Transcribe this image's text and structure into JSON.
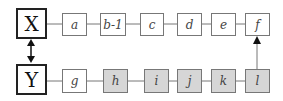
{
  "diagram": {
    "top_main": {
      "label": "X"
    },
    "bottom_main": {
      "label": "Y"
    },
    "top_row": [
      {
        "label": "a",
        "shaded": false
      },
      {
        "label": "b-1",
        "shaded": false
      },
      {
        "label": "c",
        "shaded": false
      },
      {
        "label": "d",
        "shaded": false
      },
      {
        "label": "e",
        "shaded": false
      },
      {
        "label": "f",
        "shaded": false
      }
    ],
    "bottom_row": [
      {
        "label": "g",
        "shaded": false
      },
      {
        "label": "h",
        "shaded": true
      },
      {
        "label": "i",
        "shaded": true
      },
      {
        "label": "j",
        "shaded": true
      },
      {
        "label": "k",
        "shaded": true
      },
      {
        "label": "l",
        "shaded": true
      }
    ],
    "connections": [
      {
        "from": "X",
        "to": "Y",
        "type": "bidirectional-arrow"
      },
      {
        "from": "l",
        "to": "f",
        "type": "arrow"
      }
    ],
    "colors": {
      "shaded_fill": "#d6d6d6",
      "border": "#777777"
    }
  }
}
